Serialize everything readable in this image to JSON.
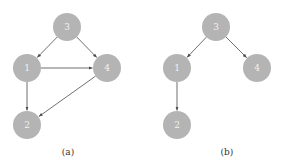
{
  "colors": {
    "node_fill": "#b4b4b4",
    "node_text": "#f2f2f2",
    "edge": "#4a4a4a",
    "caption": "#333333"
  },
  "graphs": [
    {
      "id": "a",
      "caption": "(a)",
      "caption_pos": [
        68,
        155
      ],
      "nodes": [
        {
          "id": "3",
          "label": "3",
          "x": 67,
          "y": 27
        },
        {
          "id": "1",
          "label": "1",
          "x": 27,
          "y": 68
        },
        {
          "id": "4",
          "label": "4",
          "x": 107,
          "y": 68
        },
        {
          "id": "2",
          "label": "2",
          "x": 27,
          "y": 125
        }
      ],
      "edges": [
        {
          "from": "3",
          "to": "1"
        },
        {
          "from": "3",
          "to": "4"
        },
        {
          "from": "1",
          "to": "4"
        },
        {
          "from": "1",
          "to": "2"
        },
        {
          "from": "4",
          "to": "2"
        }
      ]
    },
    {
      "id": "b",
      "caption": "(b)",
      "caption_pos": [
        227,
        155
      ],
      "nodes": [
        {
          "id": "3",
          "label": "3",
          "x": 216,
          "y": 27
        },
        {
          "id": "1",
          "label": "1",
          "x": 177,
          "y": 68
        },
        {
          "id": "4",
          "label": "4",
          "x": 257,
          "y": 68
        },
        {
          "id": "2",
          "label": "2",
          "x": 177,
          "y": 125
        }
      ],
      "edges": [
        {
          "from": "3",
          "to": "1"
        },
        {
          "from": "3",
          "to": "4"
        },
        {
          "from": "1",
          "to": "2"
        }
      ]
    }
  ],
  "node_radius": 14
}
